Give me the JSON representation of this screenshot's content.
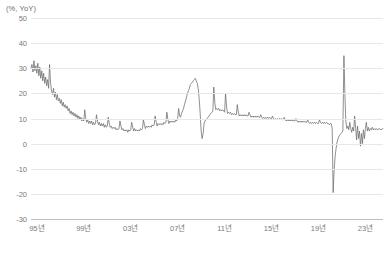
{
  "chart_data": {
    "type": "line",
    "title": "",
    "subtitle": "",
    "unit_label": "(%, YoY)",
    "xlabel": "",
    "ylabel": "(%, YoY)",
    "grid": true,
    "legend": false,
    "legend_position": "none",
    "line_color": "#6b6b6b",
    "xlim": [
      1994.5,
      2024.5
    ],
    "ylim": [
      -30,
      50
    ],
    "yticks": [
      50,
      40,
      30,
      20,
      10,
      0,
      -10,
      -20,
      -30
    ],
    "ytick_labels": [
      "50",
      "40",
      "30",
      "20",
      "10",
      "0",
      "-10",
      "-20",
      "-30"
    ],
    "xticks": [
      1995,
      1999,
      2003,
      2007,
      2011,
      2015,
      2019,
      2023
    ],
    "xtick_labels": [
      "95년",
      "99년",
      "03년",
      "07년",
      "11년",
      "15년",
      "19년",
      "23년"
    ],
    "series": [
      {
        "name": "YoY growth",
        "color": "#6b6b6b",
        "x": [
          1994.5,
          1994.58,
          1994.67,
          1994.75,
          1994.83,
          1994.92,
          1995.0,
          1995.08,
          1995.17,
          1995.25,
          1995.33,
          1995.42,
          1995.5,
          1995.58,
          1995.67,
          1995.75,
          1995.83,
          1995.92,
          1996.0,
          1996.08,
          1996.17,
          1996.25,
          1996.33,
          1996.42,
          1996.5,
          1996.58,
          1996.67,
          1996.75,
          1996.83,
          1996.92,
          1997.0,
          1997.08,
          1997.17,
          1997.25,
          1997.33,
          1997.42,
          1997.5,
          1997.58,
          1997.67,
          1997.75,
          1997.83,
          1997.92,
          1998.0,
          1998.08,
          1998.17,
          1998.25,
          1998.33,
          1998.42,
          1998.5,
          1998.58,
          1998.67,
          1998.75,
          1998.83,
          1998.92,
          1999.0,
          1999.08,
          1999.17,
          1999.25,
          1999.33,
          1999.42,
          1999.5,
          1999.58,
          1999.67,
          1999.75,
          1999.83,
          1999.92,
          2000.0,
          2000.08,
          2000.17,
          2000.25,
          2000.33,
          2000.42,
          2000.5,
          2000.58,
          2000.67,
          2000.75,
          2000.83,
          2000.92,
          2001.0,
          2001.08,
          2001.17,
          2001.25,
          2001.33,
          2001.42,
          2001.5,
          2001.58,
          2001.67,
          2001.75,
          2001.83,
          2001.92,
          2002.0,
          2002.08,
          2002.17,
          2002.25,
          2002.33,
          2002.42,
          2002.5,
          2002.58,
          2002.67,
          2002.75,
          2002.83,
          2002.92,
          2003.0,
          2003.08,
          2003.17,
          2003.25,
          2003.33,
          2003.42,
          2003.5,
          2003.58,
          2003.67,
          2003.75,
          2003.83,
          2003.92,
          2004.0,
          2004.08,
          2004.17,
          2004.25,
          2004.33,
          2004.42,
          2004.5,
          2004.58,
          2004.67,
          2004.75,
          2004.83,
          2004.92,
          2005.0,
          2005.08,
          2005.17,
          2005.25,
          2005.33,
          2005.42,
          2005.5,
          2005.58,
          2005.67,
          2005.75,
          2005.83,
          2005.92,
          2006.0,
          2006.08,
          2006.17,
          2006.25,
          2006.33,
          2006.42,
          2006.5,
          2006.58,
          2006.67,
          2006.75,
          2006.83,
          2006.92,
          2007.0,
          2007.08,
          2007.17,
          2007.25,
          2007.33,
          2007.42,
          2007.5,
          2007.58,
          2007.67,
          2007.75,
          2007.83,
          2007.92,
          2008.0,
          2008.08,
          2008.17,
          2008.25,
          2008.33,
          2008.42,
          2008.5,
          2008.58,
          2008.67,
          2008.75,
          2008.83,
          2008.92,
          2009.0,
          2009.08,
          2009.17,
          2009.25,
          2009.33,
          2009.42,
          2009.5,
          2009.58,
          2009.67,
          2009.75,
          2009.83,
          2009.92,
          2010.0,
          2010.08,
          2010.17,
          2010.25,
          2010.33,
          2010.42,
          2010.5,
          2010.58,
          2010.67,
          2010.75,
          2010.83,
          2010.92,
          2011.0,
          2011.08,
          2011.17,
          2011.25,
          2011.33,
          2011.42,
          2011.5,
          2011.58,
          2011.67,
          2011.75,
          2011.83,
          2011.92,
          2012.0,
          2012.08,
          2012.17,
          2012.25,
          2012.33,
          2012.42,
          2012.5,
          2012.58,
          2012.67,
          2012.75,
          2012.83,
          2012.92,
          2013.0,
          2013.08,
          2013.17,
          2013.25,
          2013.33,
          2013.42,
          2013.5,
          2013.58,
          2013.67,
          2013.75,
          2013.83,
          2013.92,
          2014.0,
          2014.08,
          2014.17,
          2014.25,
          2014.33,
          2014.42,
          2014.5,
          2014.58,
          2014.67,
          2014.75,
          2014.83,
          2014.92,
          2015.0,
          2015.08,
          2015.17,
          2015.25,
          2015.33,
          2015.42,
          2015.5,
          2015.58,
          2015.67,
          2015.75,
          2015.83,
          2015.92,
          2016.0,
          2016.08,
          2016.17,
          2016.25,
          2016.33,
          2016.42,
          2016.5,
          2016.58,
          2016.67,
          2016.75,
          2016.83,
          2016.92,
          2017.0,
          2017.08,
          2017.17,
          2017.25,
          2017.33,
          2017.42,
          2017.5,
          2017.58,
          2017.67,
          2017.75,
          2017.83,
          2017.92,
          2018.0,
          2018.08,
          2018.17,
          2018.25,
          2018.33,
          2018.42,
          2018.5,
          2018.58,
          2018.67,
          2018.75,
          2018.83,
          2018.92,
          2019.0,
          2019.08,
          2019.17,
          2019.25,
          2019.33,
          2019.42,
          2019.5,
          2019.58,
          2019.67,
          2019.75,
          2019.83,
          2019.92,
          2020.0,
          2020.08,
          2020.17,
          2020.25,
          2020.33,
          2020.42,
          2020.5,
          2020.58,
          2020.67,
          2020.75,
          2020.83,
          2020.92,
          2021.0,
          2021.08,
          2021.17,
          2021.25,
          2021.33,
          2021.42,
          2021.5,
          2021.58,
          2021.67,
          2021.75,
          2021.83,
          2021.92,
          2022.0,
          2022.08,
          2022.17,
          2022.25,
          2022.33,
          2022.42,
          2022.5,
          2022.58,
          2022.67,
          2022.75,
          2022.83,
          2022.92,
          2023.0,
          2023.08,
          2023.17,
          2023.25,
          2023.33,
          2023.42,
          2023.5,
          2023.58,
          2023.67,
          2023.75,
          2023.83,
          2023.92,
          2024.0,
          2024.17,
          2024.33,
          2024.5
        ],
        "y": [
          30.0,
          31.5,
          28.5,
          33.0,
          29.0,
          31.0,
          28.0,
          32.0,
          27.0,
          30.5,
          26.0,
          29.0,
          25.0,
          28.0,
          24.0,
          26.5,
          23.0,
          25.5,
          22.0,
          31.5,
          24.0,
          21.0,
          19.5,
          22.0,
          18.5,
          20.5,
          17.5,
          19.5,
          17.0,
          18.0,
          16.0,
          17.5,
          15.0,
          16.5,
          14.5,
          15.5,
          14.0,
          15.0,
          13.0,
          14.0,
          12.0,
          13.0,
          11.5,
          12.5,
          11.0,
          12.0,
          10.5,
          11.5,
          10.0,
          11.0,
          9.5,
          10.5,
          9.0,
          10.0,
          9.0,
          13.5,
          10.0,
          8.5,
          9.5,
          8.0,
          9.0,
          8.0,
          9.0,
          7.5,
          8.5,
          7.5,
          8.0,
          11.5,
          9.0,
          7.5,
          8.5,
          7.0,
          8.0,
          7.0,
          8.0,
          6.5,
          7.5,
          6.5,
          7.0,
          10.5,
          8.0,
          6.5,
          7.0,
          6.0,
          6.5,
          6.0,
          6.5,
          5.5,
          6.0,
          5.5,
          6.0,
          9.0,
          7.0,
          5.5,
          6.0,
          5.0,
          5.5,
          5.0,
          5.5,
          4.5,
          5.5,
          5.0,
          5.5,
          8.5,
          6.5,
          5.0,
          6.0,
          5.0,
          5.5,
          5.0,
          5.5,
          5.0,
          6.0,
          5.5,
          6.0,
          9.5,
          7.5,
          6.0,
          7.0,
          6.5,
          7.0,
          6.5,
          7.0,
          6.5,
          7.5,
          7.0,
          7.5,
          11.0,
          8.5,
          7.0,
          8.0,
          7.5,
          8.0,
          7.5,
          8.0,
          7.5,
          8.5,
          8.0,
          8.5,
          12.5,
          9.5,
          8.0,
          9.0,
          8.5,
          9.0,
          8.5,
          9.0,
          8.5,
          9.5,
          9.0,
          10.0,
          14.0,
          11.0,
          10.5,
          12.0,
          13.0,
          14.0,
          15.5,
          17.0,
          18.5,
          20.0,
          21.0,
          22.0,
          23.5,
          24.0,
          24.5,
          25.0,
          25.5,
          26.0,
          25.0,
          24.0,
          22.0,
          18.0,
          12.0,
          5.0,
          2.0,
          4.0,
          8.0,
          9.0,
          9.5,
          10.0,
          10.5,
          11.0,
          11.5,
          12.0,
          12.5,
          13.0,
          22.5,
          16.0,
          13.5,
          14.0,
          13.5,
          14.0,
          13.0,
          13.5,
          13.0,
          13.5,
          13.0,
          12.5,
          20.0,
          14.5,
          12.0,
          12.5,
          12.0,
          12.5,
          11.5,
          12.0,
          11.5,
          12.0,
          11.5,
          11.5,
          15.5,
          12.5,
          11.0,
          11.5,
          11.0,
          11.5,
          11.0,
          11.5,
          11.0,
          11.5,
          11.0,
          11.0,
          12.5,
          11.5,
          10.5,
          11.0,
          10.5,
          11.0,
          10.5,
          11.0,
          10.5,
          11.0,
          10.5,
          10.5,
          11.5,
          10.5,
          10.0,
          10.5,
          10.0,
          10.5,
          10.0,
          10.5,
          10.0,
          10.5,
          10.0,
          10.0,
          11.0,
          10.0,
          9.5,
          10.0,
          9.5,
          10.0,
          9.5,
          10.0,
          9.5,
          10.0,
          9.5,
          9.5,
          10.5,
          9.5,
          9.0,
          9.5,
          9.0,
          9.5,
          9.0,
          9.5,
          9.0,
          9.5,
          9.0,
          9.0,
          10.0,
          9.0,
          8.5,
          9.0,
          8.5,
          9.0,
          8.5,
          9.0,
          8.5,
          9.0,
          8.5,
          8.5,
          9.5,
          8.5,
          8.0,
          8.5,
          8.0,
          8.5,
          8.0,
          8.5,
          8.0,
          8.5,
          8.0,
          8.0,
          9.5,
          8.5,
          8.0,
          8.5,
          8.0,
          8.5,
          8.0,
          8.5,
          8.0,
          8.0,
          7.5,
          8.0,
          8.0,
          6.0,
          -19.5,
          -11.0,
          -5.0,
          -2.0,
          0.5,
          2.0,
          3.0,
          3.5,
          4.0,
          4.5,
          5.0,
          35.0,
          20.0,
          9.0,
          6.0,
          7.0,
          5.5,
          8.5,
          6.0,
          4.5,
          6.5,
          5.0,
          11.0,
          6.0,
          1.5,
          7.0,
          2.0,
          5.0,
          -1.0,
          4.0,
          0.0,
          5.5,
          2.0,
          6.0,
          8.5,
          5.0,
          6.5,
          5.0,
          6.0,
          5.5,
          6.5,
          5.5,
          6.0,
          5.5,
          6.0,
          5.5,
          6.0,
          5.5,
          6.0
        ]
      }
    ]
  }
}
